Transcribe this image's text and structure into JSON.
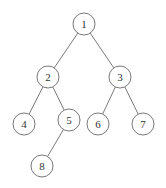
{
  "diagram": {
    "type": "binary-tree",
    "nodes": [
      {
        "id": "1",
        "label": "1",
        "x": 84,
        "y": 24
      },
      {
        "id": "2",
        "label": "2",
        "x": 48,
        "y": 77
      },
      {
        "id": "3",
        "label": "3",
        "x": 120,
        "y": 77
      },
      {
        "id": "4",
        "label": "4",
        "x": 24,
        "y": 124
      },
      {
        "id": "5",
        "label": "5",
        "x": 69,
        "y": 120
      },
      {
        "id": "6",
        "label": "6",
        "x": 98,
        "y": 124
      },
      {
        "id": "7",
        "label": "7",
        "x": 143,
        "y": 124
      },
      {
        "id": "8",
        "label": "8",
        "x": 42,
        "y": 166
      }
    ],
    "edges": [
      [
        "1",
        "2"
      ],
      [
        "1",
        "3"
      ],
      [
        "2",
        "4"
      ],
      [
        "2",
        "5"
      ],
      [
        "3",
        "6"
      ],
      [
        "3",
        "7"
      ],
      [
        "5",
        "8"
      ]
    ],
    "node_radius": 11
  }
}
